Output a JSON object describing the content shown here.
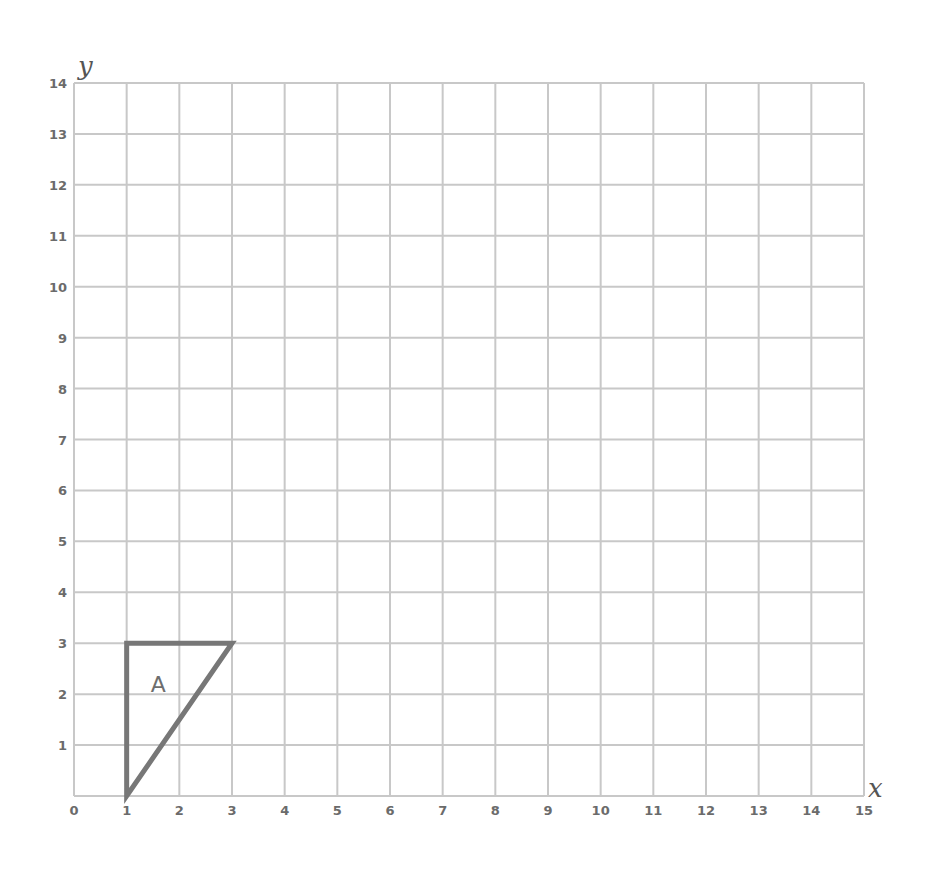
{
  "chart_data": {
    "type": "coordinate-grid",
    "xlabel": "x",
    "ylabel": "y",
    "xlim": [
      0,
      15
    ],
    "ylim": [
      0,
      14
    ],
    "grid": true,
    "x_ticks": [
      "0",
      "1",
      "2",
      "3",
      "4",
      "5",
      "6",
      "7",
      "8",
      "9",
      "10",
      "11",
      "12",
      "13",
      "14",
      "15"
    ],
    "y_ticks": [
      "1",
      "2",
      "3",
      "4",
      "5",
      "6",
      "7",
      "8",
      "9",
      "10",
      "11",
      "12",
      "13",
      "14"
    ],
    "shapes": [
      {
        "label": "A",
        "type": "triangle",
        "vertices": [
          [
            1,
            0
          ],
          [
            1,
            3
          ],
          [
            3,
            3
          ]
        ],
        "label_position": [
          1.6,
          2.2
        ]
      }
    ]
  },
  "colors": {
    "grid": "#c8c8c8",
    "shape_stroke": "#777777",
    "tick_text": "#6b6b6b"
  }
}
